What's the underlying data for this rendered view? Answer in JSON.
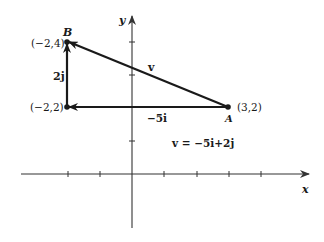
{
  "figure": {
    "axes": {
      "x_label": "x",
      "y_label": "y",
      "origin_px": [
        132,
        174
      ],
      "unit_px": [
        32.2,
        33
      ]
    },
    "points": [
      {
        "name": "B",
        "coord_label": "(−2,4)",
        "x": -2,
        "y": 4
      },
      {
        "name": "",
        "coord_label": "(−2,2)",
        "x": -2,
        "y": 2
      },
      {
        "name": "A",
        "coord_label": "(3,2)",
        "x": 3,
        "y": 2
      }
    ],
    "vectors": [
      {
        "label": "v",
        "from": [
          3,
          2
        ],
        "to": [
          -2,
          4
        ]
      },
      {
        "label": "−5i",
        "from": [
          3,
          2
        ],
        "to": [
          -2,
          2
        ]
      },
      {
        "label": "2j",
        "from": [
          -2,
          2
        ],
        "to": [
          -2,
          4
        ]
      }
    ],
    "equation": "v = −5i + 2j",
    "labels": {
      "B": "B",
      "A": "A",
      "B_coord": "(−2,4)",
      "mid_coord": "(−2,2)",
      "A_coord": "(3,2)",
      "v": "v",
      "neg5i": "−5i",
      "twoj": "2j",
      "equation": "v = −5i+2j",
      "x_axis": "x",
      "y_axis": "y"
    },
    "colors": {
      "ink": "#1a1a1a",
      "axis": "#333333",
      "background": "#ffffff"
    }
  }
}
